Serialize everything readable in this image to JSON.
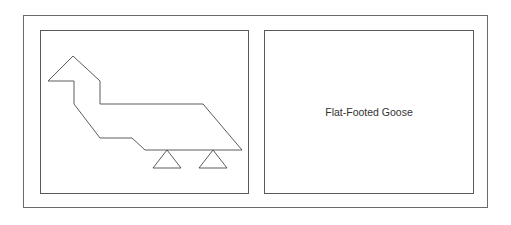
{
  "diagram": {
    "caption": "Flat-Footed Goose",
    "stroke_color": "#4a4a4a",
    "frame_color": "#6a6a6a"
  }
}
